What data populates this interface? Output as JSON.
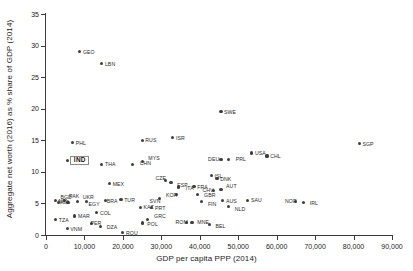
{
  "chart_data": {
    "type": "scatter",
    "title": "",
    "xlabel": "GDP per capita PPP (2014)",
    "ylabel": "Aggregate net worth (2016) as % share of GDP (2014)",
    "xlim": [
      0,
      90000
    ],
    "ylim": [
      0,
      35
    ],
    "xticks": [
      "0",
      "10,000",
      "20,000",
      "30,000",
      "40,000",
      "50,000",
      "60,000",
      "70,000",
      "80,000",
      "90,000"
    ],
    "xtick_values": [
      0,
      10000,
      20000,
      30000,
      40000,
      50000,
      60000,
      70000,
      80000,
      90000
    ],
    "yticks": [
      "0",
      "5",
      "10",
      "15",
      "20",
      "25",
      "30",
      "35"
    ],
    "ytick_values": [
      0,
      5,
      10,
      15,
      20,
      25,
      30,
      35
    ],
    "grid": false,
    "legend": false,
    "marker_color": "#3d3d3d",
    "highlight": "IND",
    "points": [
      {
        "label": "GEO",
        "x": 8800,
        "y": 29.0
      },
      {
        "label": "LBN",
        "x": 14500,
        "y": 27.1
      },
      {
        "label": "SWE",
        "x": 45500,
        "y": 19.5
      },
      {
        "label": "ISR",
        "x": 33000,
        "y": 15.4
      },
      {
        "label": "RUS",
        "x": 25000,
        "y": 15.0
      },
      {
        "label": "PHL",
        "x": 6900,
        "y": 14.6
      },
      {
        "label": "SGP",
        "x": 81500,
        "y": 14.5
      },
      {
        "label": "USA",
        "x": 53500,
        "y": 13.0
      },
      {
        "label": "CHL",
        "x": 57500,
        "y": 12.5
      },
      {
        "label": "DEU",
        "x": 45500,
        "y": 12.0
      },
      {
        "label": "PRL",
        "x": 47500,
        "y": 12.0
      },
      {
        "label": "IND",
        "x": 5500,
        "y": 11.8
      },
      {
        "label": "THA",
        "x": 14500,
        "y": 11.2
      },
      {
        "label": "CHN",
        "x": 22500,
        "y": 11.2
      },
      {
        "label": "MYS",
        "x": 25000,
        "y": 11.6
      },
      {
        "label": "ISL",
        "x": 43000,
        "y": 9.4
      },
      {
        "label": "DNK",
        "x": 44500,
        "y": 8.9
      },
      {
        "label": "CZE",
        "x": 31000,
        "y": 8.6
      },
      {
        "label": "ESP",
        "x": 32500,
        "y": 8.3
      },
      {
        "label": "MEX",
        "x": 16500,
        "y": 8.1
      },
      {
        "label": "ITA",
        "x": 34500,
        "y": 7.6
      },
      {
        "label": "FRA",
        "x": 38500,
        "y": 7.7
      },
      {
        "label": "CHV",
        "x": 43500,
        "y": 7.0
      },
      {
        "label": "AUT",
        "x": 45500,
        "y": 7.2
      },
      {
        "label": "KOR",
        "x": 34000,
        "y": 6.4
      },
      {
        "label": "GBR",
        "x": 39500,
        "y": 6.4
      },
      {
        "label": "SVN",
        "x": 29500,
        "y": 5.8
      },
      {
        "label": "TUR",
        "x": 19500,
        "y": 5.6
      },
      {
        "label": "SAU",
        "x": 52500,
        "y": 5.5
      },
      {
        "label": "AUS",
        "x": 46000,
        "y": 5.4
      },
      {
        "label": "FIN",
        "x": 40500,
        "y": 5.3
      },
      {
        "label": "NOR",
        "x": 65000,
        "y": 5.3
      },
      {
        "label": "IRL",
        "x": 67000,
        "y": 5.2
      },
      {
        "label": "NPL",
        "x": 2400,
        "y": 5.4
      },
      {
        "label": "NGA",
        "x": 5700,
        "y": 5.2
      },
      {
        "label": "EGY",
        "x": 10500,
        "y": 5.3
      },
      {
        "label": "UKR",
        "x": 8200,
        "y": 5.3
      },
      {
        "label": "PAK",
        "x": 4900,
        "y": 5.4
      },
      {
        "label": "BGD",
        "x": 3200,
        "y": 5.2
      },
      {
        "label": "BRA",
        "x": 15500,
        "y": 5.4
      },
      {
        "label": "NLD",
        "x": 47500,
        "y": 4.5
      },
      {
        "label": "KAZ",
        "x": 24500,
        "y": 4.4
      },
      {
        "label": "PRT",
        "x": 27500,
        "y": 4.3
      },
      {
        "label": "COL",
        "x": 13200,
        "y": 3.5
      },
      {
        "label": "MAR",
        "x": 7500,
        "y": 3.0
      },
      {
        "label": "TZA",
        "x": 2500,
        "y": 2.4
      },
      {
        "label": "GRC",
        "x": 26500,
        "y": 2.5
      },
      {
        "label": "POL",
        "x": 25000,
        "y": 1.9
      },
      {
        "label": "ROM",
        "x": 36500,
        "y": 2.0
      },
      {
        "label": "MNE",
        "x": 38000,
        "y": 2.0
      },
      {
        "label": "BEL",
        "x": 42500,
        "y": 1.6
      },
      {
        "label": "DZA",
        "x": 14200,
        "y": 1.4
      },
      {
        "label": "PER",
        "x": 11800,
        "y": 1.8
      },
      {
        "label": "VNM",
        "x": 5500,
        "y": 1.0
      },
      {
        "label": "ROU",
        "x": 20000,
        "y": 0.4
      }
    ],
    "label_offsets": {
      "CHN": {
        "dx": 4,
        "dy": -1
      },
      "MYS": {
        "dx": 3,
        "dy": -4
      },
      "PRL": {
        "dx": 4,
        "dy": 0
      },
      "DEU": {
        "dx": -16,
        "dy": 0
      },
      "AUT": {
        "dx": 2,
        "dy": -4
      },
      "CHV": {
        "dx": -14,
        "dy": -1
      },
      "ESP": {
        "dx": 3,
        "dy": 2
      },
      "CZE": {
        "dx": -13,
        "dy": -3
      },
      "ITA": {
        "dx": 4,
        "dy": 1
      },
      "SVN": {
        "dx": -13,
        "dy": 2
      },
      "NLD": {
        "dx": 3,
        "dy": 2
      },
      "IRL": {
        "dx": 3,
        "dy": 1
      },
      "NOR": {
        "dx": -14,
        "dy": -1
      },
      "FIN": {
        "dx": 3,
        "dy": 2
      },
      "GBR": {
        "dx": 3,
        "dy": 0
      },
      "KOR": {
        "dx": -14,
        "dy": 0
      },
      "BGD": {
        "dx": -1,
        "dy": -5
      },
      "PAK": {
        "dx": 1,
        "dy": -5
      },
      "UKR": {
        "dx": 2,
        "dy": -5
      },
      "EGY": {
        "dx": -1,
        "dy": 2
      },
      "NGA": {
        "dx": -13,
        "dy": 0
      },
      "BRA": {
        "dx": -2,
        "dy": 0
      },
      "DZA": {
        "dx": 3,
        "dy": 1
      },
      "PER": {
        "dx": -4,
        "dy": -1
      },
      "GRC": {
        "dx": 3,
        "dy": -3
      },
      "POL": {
        "dx": 2,
        "dy": 1
      },
      "MNE": {
        "dx": 2,
        "dy": -1
      },
      "ROM": {
        "dx": -14,
        "dy": -1
      },
      "BEL": {
        "dx": 3,
        "dy": 1
      }
    }
  }
}
